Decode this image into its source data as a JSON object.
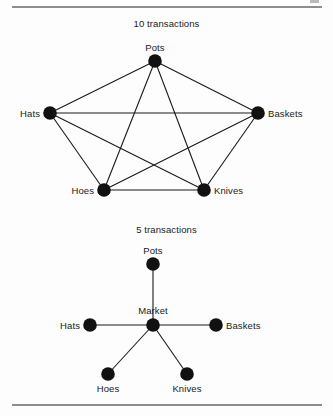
{
  "page": {
    "background_color": "#fdfdfd",
    "rule_color": "#8d8d8d",
    "node_color": "#111111",
    "edge_color": "#1a1a1a"
  },
  "figures": [
    {
      "id": "figure-top",
      "caption": "10 transactions",
      "type": "complete-graph",
      "node_radius": 6.8,
      "nodes": [
        {
          "id": "pots",
          "label": "Pots",
          "x": 155,
          "y": 47,
          "label_pos": "above",
          "label_dx": 0,
          "label_dy": -8
        },
        {
          "id": "hats",
          "label": "Hats",
          "x": 50,
          "y": 99,
          "label_pos": "left",
          "label_dx": -10,
          "label_dy": 0
        },
        {
          "id": "baskets",
          "label": "Baskets",
          "x": 258,
          "y": 99,
          "label_pos": "right",
          "label_dx": 10,
          "label_dy": 0
        },
        {
          "id": "hoes",
          "label": "Hoes",
          "x": 104,
          "y": 176,
          "label_pos": "left",
          "label_dx": -10,
          "label_dy": 0
        },
        {
          "id": "knives",
          "label": "Knives",
          "x": 204,
          "y": 176,
          "label_pos": "right",
          "label_dx": 10,
          "label_dy": 0
        }
      ],
      "edges": [
        [
          "pots",
          "hats"
        ],
        [
          "pots",
          "baskets"
        ],
        [
          "pots",
          "hoes"
        ],
        [
          "pots",
          "knives"
        ],
        [
          "hats",
          "baskets"
        ],
        [
          "hats",
          "hoes"
        ],
        [
          "hats",
          "knives"
        ],
        [
          "baskets",
          "hoes"
        ],
        [
          "baskets",
          "knives"
        ],
        [
          "hoes",
          "knives"
        ]
      ],
      "edge_count": 10
    },
    {
      "id": "figure-bottom",
      "caption": "5 transactions",
      "type": "star-graph",
      "node_radius": 6.8,
      "nodes": [
        {
          "id": "pots",
          "label": "Pots",
          "x": 153,
          "y": 44,
          "label_pos": "above",
          "label_dx": 0,
          "label_dy": -8
        },
        {
          "id": "market",
          "label": "Market",
          "x": 153,
          "y": 105,
          "label_pos": "above",
          "label_dx": 0,
          "label_dy": -9
        },
        {
          "id": "hats",
          "label": "Hats",
          "x": 90,
          "y": 105,
          "label_pos": "left",
          "label_dx": -10,
          "label_dy": 0
        },
        {
          "id": "baskets",
          "label": "Baskets",
          "x": 216,
          "y": 105,
          "label_pos": "right",
          "label_dx": 10,
          "label_dy": 0
        },
        {
          "id": "hoes",
          "label": "Hoes",
          "x": 108,
          "y": 154,
          "label_pos": "below",
          "label_dx": 0,
          "label_dy": 9
        },
        {
          "id": "knives",
          "label": "Knives",
          "x": 187,
          "y": 154,
          "label_pos": "below",
          "label_dx": 0,
          "label_dy": 9
        }
      ],
      "edges": [
        [
          "market",
          "pots"
        ],
        [
          "market",
          "hats"
        ],
        [
          "market",
          "baskets"
        ],
        [
          "market",
          "hoes"
        ],
        [
          "market",
          "knives"
        ]
      ],
      "edge_count": 5
    }
  ]
}
